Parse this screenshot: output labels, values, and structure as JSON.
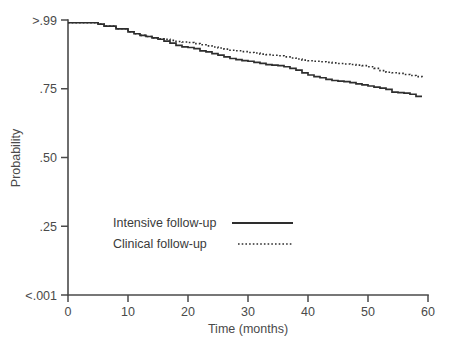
{
  "chart_data": {
    "type": "line",
    "title": "",
    "subtitle": "",
    "xlabel": "Time (months)",
    "ylabel": "Probability",
    "xlim": [
      0,
      60
    ],
    "ylim": [
      0,
      1
    ],
    "grid": false,
    "legend_position": "center-left-inside",
    "x_ticks": [
      {
        "value": 0,
        "label": "0"
      },
      {
        "value": 10,
        "label": "10"
      },
      {
        "value": 20,
        "label": "20"
      },
      {
        "value": 30,
        "label": "30"
      },
      {
        "value": 40,
        "label": "40"
      },
      {
        "value": 50,
        "label": "50"
      },
      {
        "value": 60,
        "label": "60"
      }
    ],
    "y_ticks": [
      {
        "value": 1.0,
        "label": ">.99"
      },
      {
        "value": 0.75,
        "label": ".75"
      },
      {
        "value": 0.5,
        "label": ".50"
      },
      {
        "value": 0.25,
        "label": ".25"
      },
      {
        "value": 0.0,
        "label": "<.001"
      }
    ],
    "series": [
      {
        "name": "Intensive follow-up",
        "style": "solid",
        "color": "#2e2e2e",
        "x": [
          0,
          2,
          4,
          5,
          6,
          8,
          10,
          11,
          12,
          13,
          14,
          15,
          16,
          17,
          18,
          19,
          20,
          21,
          22,
          23,
          24,
          25,
          26,
          27,
          28,
          29,
          30,
          31,
          32,
          33,
          34,
          35,
          36,
          37,
          38,
          39,
          40,
          41,
          42,
          43,
          44,
          45,
          46,
          47,
          48,
          49,
          50,
          51,
          52,
          53,
          54,
          55,
          56,
          57,
          58,
          59
        ],
        "y": [
          0.99,
          0.99,
          0.99,
          0.985,
          0.978,
          0.968,
          0.957,
          0.95,
          0.944,
          0.94,
          0.935,
          0.93,
          0.923,
          0.916,
          0.908,
          0.902,
          0.9,
          0.896,
          0.888,
          0.884,
          0.878,
          0.872,
          0.866,
          0.86,
          0.856,
          0.852,
          0.85,
          0.846,
          0.842,
          0.838,
          0.836,
          0.834,
          0.83,
          0.824,
          0.818,
          0.808,
          0.8,
          0.794,
          0.79,
          0.784,
          0.78,
          0.778,
          0.776,
          0.772,
          0.768,
          0.764,
          0.76,
          0.756,
          0.752,
          0.748,
          0.738,
          0.736,
          0.734,
          0.73,
          0.722,
          0.722
        ]
      },
      {
        "name": "Clinical follow-up",
        "style": "dotted",
        "color": "#2e2e2e",
        "x": [
          0,
          2,
          4,
          5,
          6,
          8,
          10,
          11,
          12,
          13,
          14,
          15,
          16,
          17,
          18,
          19,
          20,
          21,
          22,
          23,
          24,
          25,
          26,
          27,
          28,
          29,
          30,
          31,
          32,
          33,
          34,
          35,
          36,
          37,
          38,
          39,
          40,
          41,
          42,
          43,
          44,
          45,
          46,
          47,
          48,
          49,
          50,
          51,
          52,
          53,
          54,
          55,
          56,
          57,
          58,
          59
        ],
        "y": [
          0.99,
          0.99,
          0.99,
          0.985,
          0.978,
          0.968,
          0.957,
          0.95,
          0.944,
          0.94,
          0.935,
          0.932,
          0.93,
          0.926,
          0.922,
          0.92,
          0.918,
          0.914,
          0.91,
          0.906,
          0.902,
          0.898,
          0.894,
          0.89,
          0.888,
          0.885,
          0.882,
          0.88,
          0.876,
          0.874,
          0.872,
          0.87,
          0.866,
          0.862,
          0.858,
          0.854,
          0.852,
          0.85,
          0.848,
          0.846,
          0.844,
          0.842,
          0.84,
          0.838,
          0.836,
          0.834,
          0.83,
          0.824,
          0.816,
          0.81,
          0.808,
          0.806,
          0.802,
          0.798,
          0.794,
          0.79
        ]
      }
    ],
    "legend": [
      {
        "label": "Intensive follow-up",
        "style": "solid"
      },
      {
        "label": "Clinical follow-up",
        "style": "dotted"
      }
    ]
  }
}
